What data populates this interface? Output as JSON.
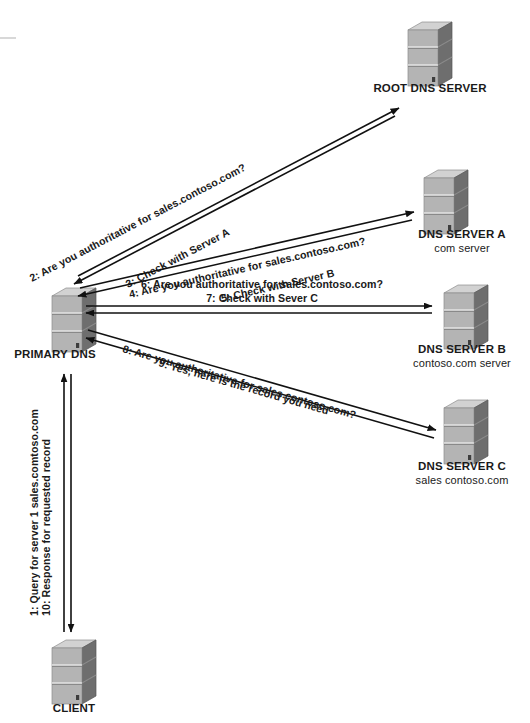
{
  "diagram": {
    "colors": {
      "server_front": "#b4b4b4",
      "server_side": "#6e6e6e",
      "server_top": "#d2d2d2",
      "server_band": "#9a9a9a",
      "arrow": "#111111",
      "text": "#1a1a1a",
      "background": "#ffffff"
    },
    "nodes": [
      {
        "id": "root-dns-server",
        "label": "ROOT DNS SERVER",
        "sublabel": "",
        "x": 408,
        "y": 22,
        "label_x": 430,
        "label_y": 92
      },
      {
        "id": "dns-server-a",
        "label": "DNS SERVER A",
        "sublabel": "com server",
        "x": 424,
        "y": 170,
        "label_x": 462,
        "label_y": 238,
        "sublabel_y": 252
      },
      {
        "id": "dns-server-b",
        "label": "DNS SERVER B",
        "sublabel": "contoso.com server",
        "x": 444,
        "y": 298,
        "label_x": 462,
        "label_y": 353,
        "sublabel_y": 367
      },
      {
        "id": "dns-server-c",
        "label": "DNS SERVER C",
        "sublabel": "sales contoso.com",
        "x": 472,
        "y": 410,
        "label_x": 462,
        "label_y": 470,
        "sublabel_y": 484
      },
      {
        "id": "primary-dns",
        "label": "PRIMARY DNS",
        "sublabel": "",
        "x": 52,
        "y": 288,
        "label_x": 55,
        "label_y": 355
      },
      {
        "id": "client",
        "label": "CLIENT",
        "sublabel": "",
        "x": 52,
        "y": 640,
        "label_x": 74,
        "label_y": 710
      }
    ],
    "flows": [
      {
        "id": "flow-2",
        "step": "2",
        "text": "2: Are you authoritative for sales.contoso.com?",
        "from": "primary-dns",
        "to": "root-dns-server"
      },
      {
        "id": "flow-3",
        "step": "3",
        "text": "3: Check with Server A",
        "from": "root-dns-server",
        "to": "primary-dns"
      },
      {
        "id": "flow-4",
        "step": "4",
        "text": "4: Are you authoritative for sales.contoso.com?",
        "from": "primary-dns",
        "to": "dns-server-a"
      },
      {
        "id": "flow-5",
        "step": "5",
        "text": "5: Check with Server B",
        "from": "dns-server-a",
        "to": "primary-dns"
      },
      {
        "id": "flow-6",
        "step": "6",
        "text": "6: Are you authoritative for sales.contoso.com?",
        "from": "primary-dns",
        "to": "dns-server-b"
      },
      {
        "id": "flow-7",
        "step": "7",
        "text": "7: Check with Sever C",
        "from": "dns-server-b",
        "to": "primary-dns"
      },
      {
        "id": "flow-8",
        "step": "8",
        "text": "8: Are you authoritative for sales.contoso.com?",
        "from": "primary-dns",
        "to": "dns-server-c"
      },
      {
        "id": "flow-9",
        "step": "9",
        "text": "9: Yes, here is the record you need",
        "from": "dns-server-c",
        "to": "primary-dns"
      },
      {
        "id": "flow-1",
        "step": "1",
        "text": "1: Query for server 1 sales.comtoso.com",
        "from": "client",
        "to": "primary-dns"
      },
      {
        "id": "flow-10",
        "step": "10",
        "text": "10: Response for requested record",
        "from": "primary-dns",
        "to": "client"
      }
    ]
  }
}
